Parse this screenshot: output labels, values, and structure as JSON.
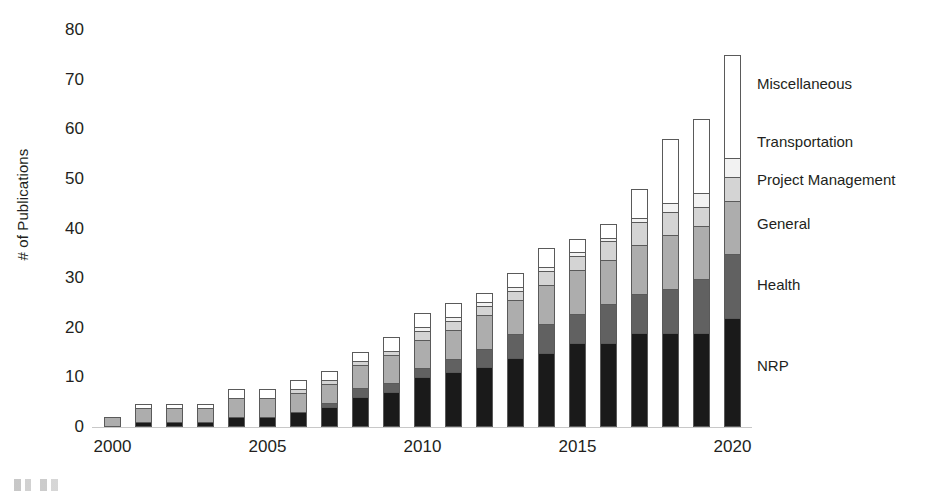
{
  "chart_data": {
    "type": "bar",
    "subtype": "stacked-bar",
    "title": "",
    "xlabel": "",
    "ylabel": "# of Publications",
    "ylim": [
      0,
      80
    ],
    "yticks": [
      0,
      10,
      20,
      30,
      40,
      50,
      60,
      70,
      80
    ],
    "grid": false,
    "legend_position": "right-inline",
    "categories": [
      "2000",
      "2001",
      "2002",
      "2003",
      "2004",
      "2005",
      "2006",
      "2007",
      "2008",
      "2009",
      "2010",
      "2011",
      "2012",
      "2013",
      "2014",
      "2015",
      "2016",
      "2017",
      "2018",
      "2019",
      "2020"
    ],
    "xtick_labels": [
      "2000",
      "2005",
      "2010",
      "2015",
      "2020"
    ],
    "series": [
      {
        "name": "NRP",
        "color": "#1a1a1a",
        "values": [
          0,
          1,
          1,
          1,
          2,
          2,
          3,
          4,
          6,
          7,
          10,
          11,
          12,
          14,
          15,
          17,
          17,
          19,
          19,
          19,
          22
        ]
      },
      {
        "name": "Health",
        "color": "#616161",
        "values": [
          0,
          0,
          0,
          0,
          0,
          0,
          0,
          1,
          2,
          2,
          2,
          3,
          4,
          5,
          6,
          6,
          8,
          8,
          9,
          11,
          13
        ]
      },
      {
        "name": "General",
        "color": "#adadad",
        "values": [
          2,
          3,
          3,
          3,
          4,
          4,
          4,
          4,
          5,
          6,
          6,
          6,
          7,
          7,
          8,
          9,
          9,
          10,
          11,
          11,
          11
        ]
      },
      {
        "name": "Project Management",
        "color": "#d4d4d4",
        "values": [
          0,
          0,
          0,
          0,
          0,
          0,
          1,
          1,
          1,
          1,
          2,
          2,
          2,
          2,
          3,
          3,
          4,
          5,
          5,
          4,
          5
        ]
      },
      {
        "name": "Transportation",
        "color": "#f2f2f2",
        "values": [
          0,
          0,
          0,
          0,
          0,
          0,
          0,
          0,
          0,
          0,
          1,
          1,
          1,
          1,
          1,
          1,
          1,
          1,
          2,
          3,
          4
        ]
      },
      {
        "name": "Miscellaneous",
        "color": "#ffffff",
        "values": [
          0,
          1,
          1,
          1,
          2,
          2,
          2,
          2,
          2,
          3,
          3,
          3,
          2,
          3,
          4,
          3,
          3,
          6,
          13,
          15,
          21
        ]
      }
    ],
    "totals": [
      2,
      5,
      5,
      5,
      8,
      8,
      10,
      12,
      16,
      19,
      24,
      26,
      28,
      32,
      37,
      39,
      42,
      49,
      59,
      63,
      76
    ]
  },
  "legend": [
    {
      "label": "Miscellaneous",
      "top": 75
    },
    {
      "label": "Transportation",
      "top": 133
    },
    {
      "label": "Project Management",
      "top": 171
    },
    {
      "label": "General",
      "top": 215
    },
    {
      "label": "Health",
      "top": 276
    },
    {
      "label": "NRP",
      "top": 357
    }
  ],
  "axis": {
    "bar_outline_color": "#5a5a5a",
    "baseline_color": "#c8c8c8",
    "text_color": "#231f20"
  }
}
